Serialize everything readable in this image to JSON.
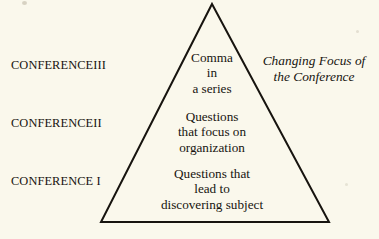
{
  "figure": {
    "name": "conference-pyramid-diagram",
    "background_color": "#faf8ec",
    "ink_color": "#17140f"
  },
  "stages": [
    {
      "id": "stage-3",
      "label": "CONFERENCEIII"
    },
    {
      "id": "stage-2",
      "label": "CONFERENCEII"
    },
    {
      "id": "stage-1",
      "label": "CONFERENCE I"
    }
  ],
  "tiers": [
    {
      "id": "tier-3",
      "lines": [
        "Comma",
        "in",
        "a series"
      ]
    },
    {
      "id": "tier-2",
      "lines": [
        "Questions",
        "that focus on",
        "organization"
      ]
    },
    {
      "id": "tier-1",
      "lines": [
        "Questions that",
        "lead to",
        "discovering subject"
      ]
    }
  ],
  "caption": {
    "lines": [
      "Changing Focus of",
      "the Conference"
    ]
  },
  "shape": {
    "type": "triangle",
    "apex": {
      "x": 212,
      "y": 4
    },
    "base_left": {
      "x": 101,
      "y": 222
    },
    "base_right": {
      "x": 329,
      "y": 222
    },
    "stroke_width": 2,
    "stroke_color": "#17140f"
  }
}
